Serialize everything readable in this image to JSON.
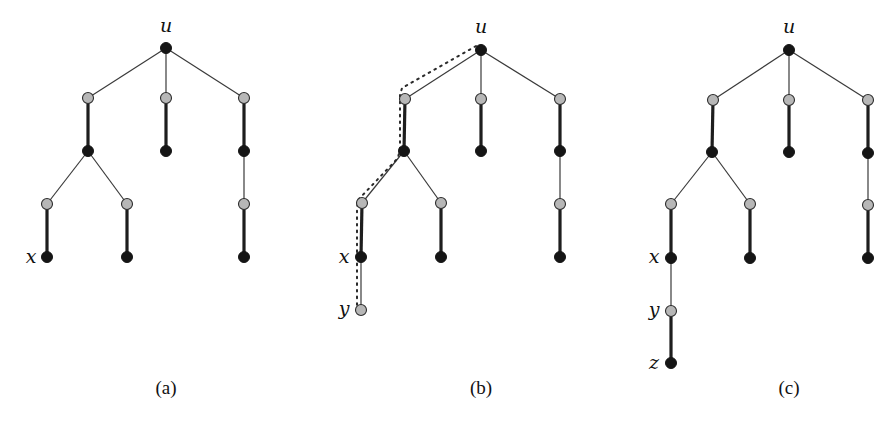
{
  "figure": {
    "node_radius": 5.5,
    "colors": {
      "black_node": "#151515",
      "gray_node": "#b7b7b7",
      "edge": "#1e1e1e",
      "background": "#ffffff"
    },
    "panels": [
      {
        "id": "a",
        "caption": "(a)",
        "caption_pos": [
          166,
          394
        ],
        "nodes": [
          {
            "id": "u",
            "x": 166,
            "y": 48,
            "color": "black",
            "label": "u",
            "label_pos": [
              166,
              32
            ]
          },
          {
            "id": "g1",
            "x": 88,
            "y": 98,
            "color": "gray"
          },
          {
            "id": "g2",
            "x": 166,
            "y": 98,
            "color": "gray"
          },
          {
            "id": "g3",
            "x": 244,
            "y": 98,
            "color": "gray"
          },
          {
            "id": "b1",
            "x": 88,
            "y": 151,
            "color": "black"
          },
          {
            "id": "b2",
            "x": 166,
            "y": 151,
            "color": "black"
          },
          {
            "id": "b3",
            "x": 244,
            "y": 151,
            "color": "black"
          },
          {
            "id": "g4",
            "x": 47,
            "y": 204,
            "color": "gray"
          },
          {
            "id": "g5",
            "x": 127,
            "y": 204,
            "color": "gray"
          },
          {
            "id": "g6",
            "x": 244,
            "y": 204,
            "color": "gray"
          },
          {
            "id": "x",
            "x": 47,
            "y": 257,
            "color": "black",
            "label": "x",
            "label_pos": [
              31,
              263
            ]
          },
          {
            "id": "b5",
            "x": 127,
            "y": 257,
            "color": "black"
          },
          {
            "id": "b6",
            "x": 244,
            "y": 257,
            "color": "black"
          }
        ],
        "edges": [
          {
            "from": "u",
            "to": "g1",
            "weight": "thin"
          },
          {
            "from": "u",
            "to": "g2",
            "weight": "thin"
          },
          {
            "from": "u",
            "to": "g3",
            "weight": "thin"
          },
          {
            "from": "g1",
            "to": "b1",
            "weight": "thick"
          },
          {
            "from": "g2",
            "to": "b2",
            "weight": "thick"
          },
          {
            "from": "g3",
            "to": "b3",
            "weight": "thick"
          },
          {
            "from": "b1",
            "to": "g4",
            "weight": "thin"
          },
          {
            "from": "b1",
            "to": "g5",
            "weight": "thin"
          },
          {
            "from": "b3",
            "to": "g6",
            "weight": "thin"
          },
          {
            "from": "g4",
            "to": "x",
            "weight": "thick"
          },
          {
            "from": "g5",
            "to": "b5",
            "weight": "thick"
          },
          {
            "from": "g6",
            "to": "b6",
            "weight": "thick"
          }
        ],
        "dotted_path": []
      },
      {
        "id": "b",
        "caption": "(b)",
        "caption_pos": [
          481,
          394
        ],
        "nodes": [
          {
            "id": "u",
            "x": 481,
            "y": 50,
            "color": "black",
            "label": "u",
            "label_pos": [
              481,
              33
            ]
          },
          {
            "id": "g1",
            "x": 405,
            "y": 99,
            "color": "gray"
          },
          {
            "id": "g2",
            "x": 481,
            "y": 99,
            "color": "gray"
          },
          {
            "id": "g3",
            "x": 560,
            "y": 99,
            "color": "gray"
          },
          {
            "id": "b1",
            "x": 404,
            "y": 151,
            "color": "black"
          },
          {
            "id": "b2",
            "x": 481,
            "y": 151,
            "color": "black"
          },
          {
            "id": "b3",
            "x": 560,
            "y": 151,
            "color": "black"
          },
          {
            "id": "g4",
            "x": 362,
            "y": 203,
            "color": "gray"
          },
          {
            "id": "g5",
            "x": 441,
            "y": 203,
            "color": "gray"
          },
          {
            "id": "g6",
            "x": 560,
            "y": 204,
            "color": "gray"
          },
          {
            "id": "x",
            "x": 361,
            "y": 257,
            "color": "black",
            "label": "x",
            "label_pos": [
              344,
              263
            ]
          },
          {
            "id": "b5",
            "x": 441,
            "y": 257,
            "color": "black"
          },
          {
            "id": "b6",
            "x": 560,
            "y": 257,
            "color": "black"
          },
          {
            "id": "y",
            "x": 361,
            "y": 310,
            "color": "gray",
            "label": "y",
            "label_pos": [
              344,
              315
            ]
          }
        ],
        "edges": [
          {
            "from": "u",
            "to": "g1",
            "weight": "thin"
          },
          {
            "from": "u",
            "to": "g2",
            "weight": "thin"
          },
          {
            "from": "u",
            "to": "g3",
            "weight": "thin"
          },
          {
            "from": "g1",
            "to": "b1",
            "weight": "thick"
          },
          {
            "from": "g2",
            "to": "b2",
            "weight": "thick"
          },
          {
            "from": "g3",
            "to": "b3",
            "weight": "thick"
          },
          {
            "from": "b1",
            "to": "g4",
            "weight": "thin"
          },
          {
            "from": "b1",
            "to": "g5",
            "weight": "thin"
          },
          {
            "from": "b3",
            "to": "g6",
            "weight": "thin"
          },
          {
            "from": "g4",
            "to": "x",
            "weight": "thick"
          },
          {
            "from": "g5",
            "to": "b5",
            "weight": "thick"
          },
          {
            "from": "g6",
            "to": "b6",
            "weight": "thick"
          },
          {
            "from": "x",
            "to": "y",
            "weight": "thin"
          }
        ],
        "dotted_path": [
          [
            476,
            46
          ],
          [
            402,
            88
          ],
          [
            400,
            95
          ],
          [
            400,
            148
          ],
          [
            398,
            158
          ],
          [
            358,
            200
          ],
          [
            357,
            208
          ],
          [
            357,
            306
          ]
        ]
      },
      {
        "id": "c",
        "caption": "(c)",
        "caption_pos": [
          789,
          394
        ],
        "nodes": [
          {
            "id": "u",
            "x": 789,
            "y": 50,
            "color": "black",
            "label": "u",
            "label_pos": [
              789,
              33
            ]
          },
          {
            "id": "g1",
            "x": 713,
            "y": 100,
            "color": "gray"
          },
          {
            "id": "g2",
            "x": 789,
            "y": 100,
            "color": "gray"
          },
          {
            "id": "g3",
            "x": 868,
            "y": 100,
            "color": "gray"
          },
          {
            "id": "b1",
            "x": 712,
            "y": 152,
            "color": "black"
          },
          {
            "id": "b2",
            "x": 789,
            "y": 152,
            "color": "black"
          },
          {
            "id": "b3",
            "x": 868,
            "y": 153,
            "color": "black"
          },
          {
            "id": "g4",
            "x": 671,
            "y": 204,
            "color": "gray"
          },
          {
            "id": "g5",
            "x": 750,
            "y": 204,
            "color": "gray"
          },
          {
            "id": "g6",
            "x": 868,
            "y": 205,
            "color": "gray"
          },
          {
            "id": "x",
            "x": 671,
            "y": 258,
            "color": "black",
            "label": "x",
            "label_pos": [
              654,
              263
            ]
          },
          {
            "id": "b5",
            "x": 750,
            "y": 258,
            "color": "black"
          },
          {
            "id": "b6",
            "x": 868,
            "y": 258,
            "color": "black"
          },
          {
            "id": "y",
            "x": 671,
            "y": 311,
            "color": "gray",
            "label": "y",
            "label_pos": [
              654,
              316
            ]
          },
          {
            "id": "z",
            "x": 671,
            "y": 363,
            "color": "black",
            "label": "z",
            "label_pos": [
              654,
              369
            ]
          }
        ],
        "edges": [
          {
            "from": "u",
            "to": "g1",
            "weight": "thin"
          },
          {
            "from": "u",
            "to": "g2",
            "weight": "thin"
          },
          {
            "from": "u",
            "to": "g3",
            "weight": "thin"
          },
          {
            "from": "g1",
            "to": "b1",
            "weight": "thick"
          },
          {
            "from": "g2",
            "to": "b2",
            "weight": "thick"
          },
          {
            "from": "g3",
            "to": "b3",
            "weight": "thick"
          },
          {
            "from": "b1",
            "to": "g4",
            "weight": "thin"
          },
          {
            "from": "b1",
            "to": "g5",
            "weight": "thin"
          },
          {
            "from": "b3",
            "to": "g6",
            "weight": "thin"
          },
          {
            "from": "g4",
            "to": "x",
            "weight": "thick"
          },
          {
            "from": "g5",
            "to": "b5",
            "weight": "thick"
          },
          {
            "from": "g6",
            "to": "b6",
            "weight": "thick"
          },
          {
            "from": "x",
            "to": "y",
            "weight": "thin"
          },
          {
            "from": "y",
            "to": "z",
            "weight": "thick"
          }
        ],
        "dotted_path": []
      }
    ]
  }
}
